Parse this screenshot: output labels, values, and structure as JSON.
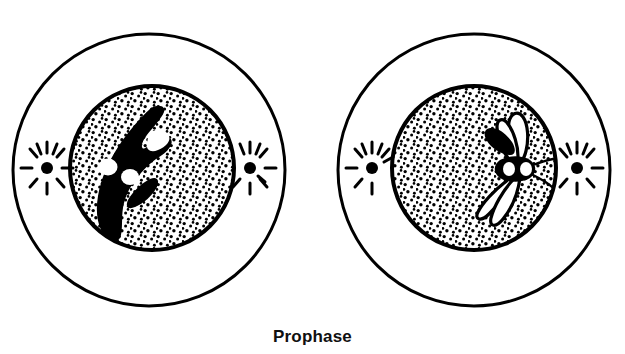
{
  "figure": {
    "title": "Prophase",
    "caption": "Prophase",
    "background_color": "#ffffff",
    "ink_color": "#000000",
    "panel_count": 2,
    "panels": [
      {
        "id": "left-cell",
        "name": "early-prophase-cell",
        "stage_label": "Prophase",
        "sub_stage": "early prophase",
        "cell_membrane": {
          "cx": 149,
          "cy": 170,
          "r": 136,
          "stroke_width": 3
        },
        "nucleus": {
          "cx": 152,
          "cy": 168,
          "r": 83,
          "stroke_width": 4,
          "stipple": true
        },
        "nucleolus_visible": false,
        "chromatin": {
          "appearance": "condensing chromatin mass",
          "fill": "solid-black",
          "shape": "boomerang",
          "centromeres": 2
        },
        "asters": [
          {
            "position": "left",
            "cx": 47,
            "cy": 168,
            "rays": 10
          },
          {
            "position": "right",
            "cx": 250,
            "cy": 168,
            "rays": 9
          }
        ]
      },
      {
        "id": "right-cell",
        "name": "late-prophase-cell",
        "stage_label": "Prophase",
        "sub_stage": "late prophase",
        "cell_membrane": {
          "cx": 474,
          "cy": 170,
          "r": 136,
          "stroke_width": 3
        },
        "nucleus": {
          "cx": 474,
          "cy": 168,
          "r": 83,
          "stroke_width": 4,
          "stipple": true
        },
        "nucleolus_visible": false,
        "chromatin": {
          "appearance": "distinct paired chromosomes",
          "fill": "outlined-white",
          "shape": "four-armed",
          "centromeres": 2
        },
        "asters": [
          {
            "position": "left",
            "cx": 372,
            "cy": 168,
            "rays": 9
          },
          {
            "position": "right",
            "cx": 577,
            "cy": 168,
            "rays": 9
          }
        ]
      }
    ]
  }
}
